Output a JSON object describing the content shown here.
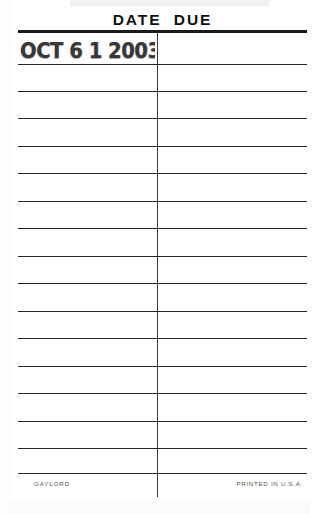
{
  "card": {
    "type": "library-date-due-slip",
    "header": {
      "title": "DATE  DUE"
    },
    "stamp": {
      "value": "OCT 6 1 2003"
    },
    "grid": {
      "row_count": 16,
      "column_divider": true
    },
    "footer": {
      "brand": "GAYLORD",
      "origin": "PRINTED IN U.S.A."
    },
    "colors": {
      "paper": "#ffffff",
      "ink": "#1a1a1a",
      "rule": "#262626",
      "faint_text": "#555555"
    }
  }
}
